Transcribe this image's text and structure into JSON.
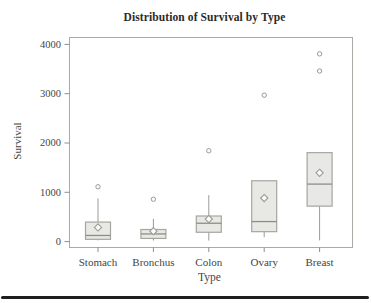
{
  "window": {
    "width": 371,
    "height": 303,
    "background": "#ffffff"
  },
  "chart_data": {
    "type": "boxplot",
    "title": "Distribution of Survival by Type",
    "xlabel": "Type",
    "ylabel": "Survival",
    "categories": [
      "Stomach",
      "Bronchus",
      "Colon",
      "Ovary",
      "Breast"
    ],
    "y_ticks": [
      0,
      1000,
      2000,
      3000,
      4000
    ],
    "ylim": [
      -120,
      4140
    ],
    "grid": false,
    "legend": "none",
    "mean_marker": "diamond",
    "outlier_marker": "open-circle",
    "series": [
      {
        "category": "Stomach",
        "whisker_low": 25,
        "q1": 46,
        "median": 124,
        "q3": 396,
        "whisker_high": 876,
        "mean": 286,
        "outliers": [
          1112
        ]
      },
      {
        "category": "Bronchus",
        "whisker_low": 20,
        "q1": 64,
        "median": 155,
        "q3": 245,
        "whisker_high": 461,
        "mean": 211,
        "outliers": [
          859
        ]
      },
      {
        "category": "Colon",
        "whisker_low": 20,
        "q1": 189,
        "median": 372,
        "q3": 519,
        "whisker_high": 942,
        "mean": 457,
        "outliers": [
          1843
        ]
      },
      {
        "category": "Ovary",
        "whisker_low": 89,
        "q1": 201,
        "median": 406,
        "q3": 1234,
        "whisker_high": 1234,
        "mean": 884,
        "outliers": [
          2970
        ]
      },
      {
        "category": "Breast",
        "whisker_low": 24,
        "q1": 719,
        "median": 1166,
        "q3": 1804,
        "whisker_high": 1804,
        "mean": 1396,
        "outliers": [
          3460,
          3808
        ]
      }
    ]
  },
  "colors": {
    "background": "#ffffff",
    "frame": "#ababa5",
    "box_fill": "#e8e8e4",
    "box_border": "#a6a6a0",
    "whisker": "#9b9b95",
    "median": "#8e8e88",
    "mean_stroke": "#9b9b95",
    "mean_fill": "#fbfbf8",
    "outlier_stroke": "#9b9b95",
    "outlier_fill": "#fcfcfa",
    "tick": "#8e8e88",
    "tick_label": "#45453f",
    "axis_title": "#45453f",
    "title": "#2b2b27",
    "bottom_rule": "#1e1e1e"
  }
}
